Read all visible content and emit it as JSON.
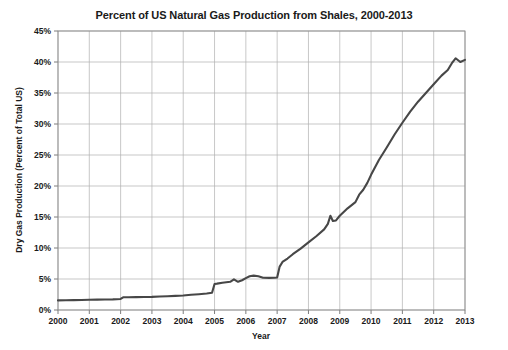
{
  "chart_data": {
    "type": "line",
    "title": "Percent of US Natural Gas Production from Shales, 2000-2013",
    "xlabel": "Year",
    "ylabel": "Dry Gas Production (Percent of Total US)",
    "xlim": [
      2000,
      2013
    ],
    "ylim": [
      0,
      45
    ],
    "grid": true,
    "legend": null,
    "legend_position": "none",
    "y_tick_labels": [
      "0%",
      "5%",
      "10%",
      "15%",
      "20%",
      "25%",
      "30%",
      "35%",
      "40%",
      "45%"
    ],
    "y_tick_values": [
      0,
      5,
      10,
      15,
      20,
      25,
      30,
      35,
      40,
      45
    ],
    "x_tick_labels": [
      "2000",
      "2001",
      "2002",
      "2003",
      "2004",
      "2005",
      "2006",
      "2007",
      "2008",
      "2009",
      "2010",
      "2011",
      "2012",
      "2013"
    ],
    "x_tick_values": [
      2000,
      2001,
      2002,
      2003,
      2004,
      2005,
      2006,
      2007,
      2008,
      2009,
      2010,
      2011,
      2012,
      2013
    ],
    "series": [
      {
        "name": "Shale gas share of US dry gas production",
        "color": "#474747",
        "x": [
          2000.0,
          2000.25,
          2000.5,
          2000.75,
          2001.0,
          2001.25,
          2001.5,
          2001.75,
          2002.0,
          2002.08,
          2002.25,
          2002.5,
          2002.75,
          2003.0,
          2003.25,
          2003.5,
          2003.75,
          2004.0,
          2004.25,
          2004.5,
          2004.75,
          2004.92,
          2005.0,
          2005.08,
          2005.25,
          2005.5,
          2005.62,
          2005.75,
          2005.88,
          2006.0,
          2006.12,
          2006.25,
          2006.4,
          2006.55,
          2006.75,
          2006.92,
          2007.0,
          2007.08,
          2007.17,
          2007.33,
          2007.5,
          2007.75,
          2008.0,
          2008.25,
          2008.5,
          2008.62,
          2008.7,
          2008.78,
          2008.88,
          2009.0,
          2009.25,
          2009.5,
          2009.62,
          2009.75,
          2009.88,
          2010.0,
          2010.25,
          2010.5,
          2010.75,
          2011.0,
          2011.25,
          2011.5,
          2011.75,
          2012.0,
          2012.25,
          2012.45,
          2012.58,
          2012.7,
          2012.85,
          2013.0
        ],
        "y": [
          1.55,
          1.58,
          1.6,
          1.62,
          1.65,
          1.68,
          1.7,
          1.72,
          1.78,
          2.05,
          2.05,
          2.08,
          2.1,
          2.12,
          2.18,
          2.22,
          2.28,
          2.35,
          2.45,
          2.55,
          2.65,
          2.78,
          4.2,
          4.25,
          4.4,
          4.55,
          4.95,
          4.55,
          4.8,
          5.15,
          5.45,
          5.55,
          5.45,
          5.2,
          5.18,
          5.2,
          5.25,
          7.0,
          7.75,
          8.3,
          9.0,
          9.9,
          10.9,
          11.9,
          13.0,
          13.9,
          15.2,
          14.35,
          14.45,
          15.2,
          16.4,
          17.4,
          18.6,
          19.4,
          20.5,
          21.8,
          24.2,
          26.2,
          28.3,
          30.2,
          32.0,
          33.6,
          35.0,
          36.4,
          37.8,
          38.7,
          39.8,
          40.6,
          40.0,
          40.35
        ]
      }
    ],
    "annotations": []
  }
}
